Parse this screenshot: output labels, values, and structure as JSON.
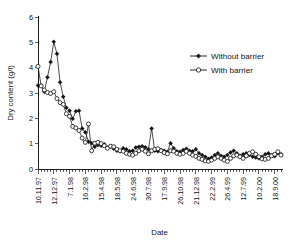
{
  "chart_data": {
    "type": "line",
    "title": "",
    "xlabel": "Date",
    "ylabel": "Dry content (g/l)",
    "ylim": [
      0,
      6
    ],
    "yticks": [
      0,
      1,
      2,
      3,
      4,
      5,
      6
    ],
    "grid": false,
    "legend_position": "top-right",
    "xtick_labels": [
      "10.11.97",
      "12.12.97",
      "7.1.98",
      "16.2.98",
      "15.4.98",
      "18.5.98",
      "24.6.98",
      "30.7.98",
      "17.9.98",
      "26.10.98",
      "21.12.98",
      "22.2.99",
      "26.4.99",
      "12.7.99",
      "10.2.00",
      "18.9.00"
    ],
    "xtick_indices": [
      0,
      5,
      10,
      15,
      20,
      25,
      30,
      35,
      40,
      45,
      50,
      55,
      60,
      65,
      70,
      75
    ],
    "n_points": 78,
    "series": [
      {
        "name": "Without barrier",
        "marker": "filled-diamond",
        "values": [
          3.3,
          3.3,
          3.05,
          3.62,
          4.22,
          5.02,
          4.55,
          3.42,
          2.85,
          2.42,
          2.3,
          1.98,
          2.28,
          2.3,
          1.6,
          1.45,
          1.08,
          1.02,
          0.88,
          0.95,
          0.92,
          0.98,
          0.85,
          0.88,
          0.8,
          0.72,
          0.7,
          0.82,
          0.78,
          0.7,
          0.72,
          0.85,
          0.88,
          0.9,
          0.86,
          0.78,
          1.6,
          0.72,
          0.7,
          0.75,
          0.72,
          0.68,
          1.02,
          0.82,
          0.7,
          0.68,
          0.75,
          0.8,
          0.72,
          0.7,
          0.78,
          0.62,
          0.55,
          0.48,
          0.4,
          0.45,
          0.55,
          0.62,
          0.52,
          0.48,
          0.55,
          0.65,
          0.72,
          0.62,
          0.52,
          0.58,
          0.62,
          0.55,
          0.48,
          0.45,
          0.42,
          0.48,
          0.58,
          0.62,
          0.55,
          0.5,
          0.62,
          0.58
        ]
      },
      {
        "name": "With barrier",
        "marker": "open-circle",
        "values": [
          4.05,
          3.28,
          3.12,
          3.02,
          2.98,
          3.05,
          2.78,
          2.62,
          2.55,
          2.18,
          2.08,
          1.68,
          1.62,
          1.52,
          1.22,
          1.05,
          1.78,
          0.72,
          1.02,
          1.05,
          1.0,
          0.92,
          0.82,
          0.9,
          0.88,
          0.78,
          0.72,
          0.7,
          0.62,
          0.58,
          0.55,
          0.62,
          0.72,
          0.78,
          0.7,
          0.6,
          0.72,
          0.78,
          0.8,
          0.72,
          0.65,
          0.6,
          0.72,
          0.7,
          0.62,
          0.58,
          0.62,
          0.7,
          0.62,
          0.55,
          0.5,
          0.42,
          0.38,
          0.32,
          0.3,
          0.35,
          0.42,
          0.48,
          0.42,
          0.35,
          0.3,
          0.42,
          0.52,
          0.55,
          0.48,
          0.42,
          0.52,
          0.62,
          0.68,
          0.58,
          0.48,
          0.4,
          0.38,
          0.42,
          0.52,
          0.58,
          0.68,
          0.55
        ]
      }
    ]
  }
}
